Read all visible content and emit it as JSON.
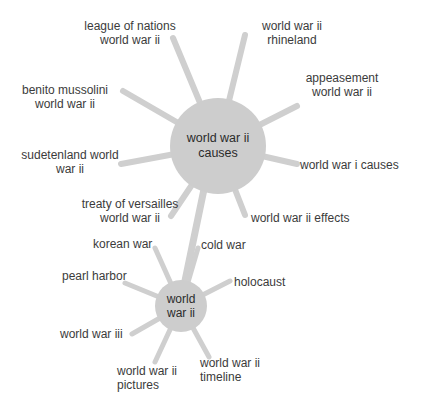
{
  "diagram": {
    "colors": {
      "background": "#ffffff",
      "hub": "#cdcdcd",
      "spoke": "#cfcfcf",
      "text": "#3b3b3b"
    },
    "main_hub": {
      "line1": "world war ii",
      "line2": "causes"
    },
    "secondary_hub": {
      "line1": "world",
      "line2": "war ii"
    },
    "main_nodes": [
      {
        "line1": "league of nations",
        "line2": "world war ii"
      },
      {
        "line1": "world war ii",
        "line2": "rhineland"
      },
      {
        "line1": "benito mussolini",
        "line2": "world war ii"
      },
      {
        "line1": "appeasement",
        "line2": "world war ii"
      },
      {
        "line1": "sudetenland world",
        "line2": "war ii"
      },
      {
        "line1": "world war i causes",
        "line2": ""
      },
      {
        "line1": "treaty of versailles",
        "line2": "world war ii"
      },
      {
        "line1": "world war ii effects",
        "line2": ""
      }
    ],
    "secondary_nodes": [
      {
        "line1": "korean war",
        "line2": ""
      },
      {
        "line1": "cold war",
        "line2": ""
      },
      {
        "line1": "pearl harbor",
        "line2": ""
      },
      {
        "line1": "holocaust",
        "line2": ""
      },
      {
        "line1": "world war iii",
        "line2": ""
      },
      {
        "line1": "world war ii",
        "line2": "pictures"
      },
      {
        "line1": "world war ii",
        "line2": "timeline"
      }
    ]
  }
}
